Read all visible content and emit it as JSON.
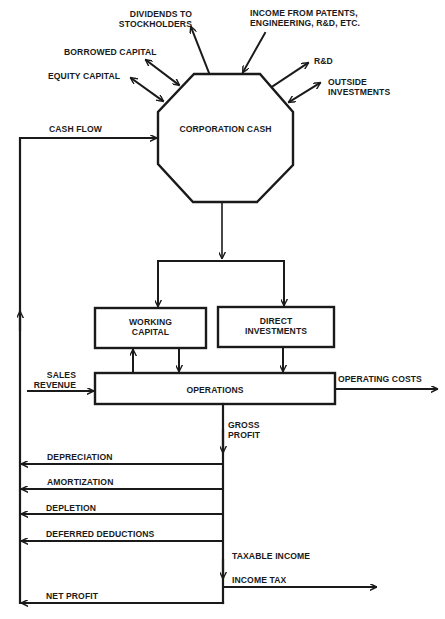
{
  "diagram": {
    "nodes": {
      "corporation_cash": "CORPORATION CASH",
      "working_capital": [
        "WORKING",
        "CAPITAL"
      ],
      "direct_investments": [
        "DIRECT",
        "INVESTMENTS"
      ],
      "operations": "OPERATIONS"
    },
    "flows": {
      "dividends": [
        "DIVIDENDS TO",
        "STOCKHOLDERS"
      ],
      "income_patents": [
        "INCOME FROM PATENTS,",
        "ENGINEERING, R&D, ETC."
      ],
      "borrowed_capital": "BORROWED CAPITAL",
      "equity_capital": "EQUITY CAPITAL",
      "rnd": "R&D",
      "outside_investments": [
        "OUTSIDE",
        "INVESTMENTS"
      ],
      "cash_flow": "CASH FLOW",
      "sales_revenue": [
        "SALES",
        "REVENUE"
      ],
      "operating_costs": "OPERATING COSTS",
      "gross_profit": [
        "GROSS",
        "PROFIT"
      ],
      "depreciation": "DEPRECIATION",
      "amortization": "AMORTIZATION",
      "depletion": "DEPLETION",
      "deferred_deductions": "DEFERRED DEDUCTIONS",
      "taxable_income": "TAXABLE INCOME",
      "income_tax": "INCOME TAX",
      "net_profit": "NET PROFIT"
    },
    "colors": {
      "ink": "#1a1a1a",
      "background": "#ffffff"
    }
  }
}
